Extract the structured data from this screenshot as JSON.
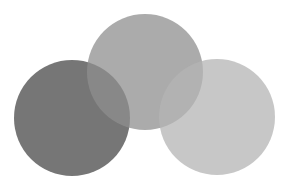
{
  "background": "#ffffff",
  "circles": [
    {
      "id": "left",
      "cx": 72,
      "cy": 118,
      "r": 58,
      "color": "#5e5e5e",
      "opacity": 0.85
    },
    {
      "id": "middle",
      "cx": 145,
      "cy": 72,
      "r": 58,
      "color": "#8f8f8f",
      "opacity": 0.75
    },
    {
      "id": "right",
      "cx": 217,
      "cy": 117,
      "r": 58,
      "color": "#b4b4b4",
      "opacity": 0.75
    }
  ]
}
